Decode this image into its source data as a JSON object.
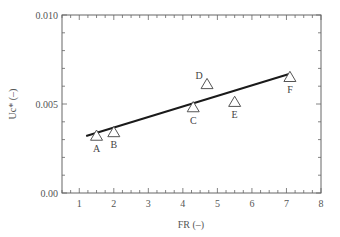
{
  "chart_data": {
    "type": "scatter",
    "title": "",
    "xlabel": "FR (–)",
    "ylabel": "Uc* (–)",
    "xlim": [
      0.5,
      8
    ],
    "ylim": [
      0.0,
      0.01
    ],
    "x_ticks": [
      1,
      2,
      3,
      4,
      5,
      6,
      7,
      8
    ],
    "y_ticks": [
      {
        "value": 0.0,
        "label": "0.00"
      },
      {
        "value": 0.005,
        "label": "0.005"
      },
      {
        "value": 0.01,
        "label": "0.010"
      }
    ],
    "grid": false,
    "legend": null,
    "series": [
      {
        "name": "Measured",
        "marker": "open-triangle",
        "points": [
          {
            "label": "A",
            "x": 1.5,
            "y": 0.0032
          },
          {
            "label": "B",
            "x": 2.0,
            "y": 0.0034
          },
          {
            "label": "C",
            "x": 4.3,
            "y": 0.0048
          },
          {
            "label": "D",
            "x": 4.7,
            "y": 0.0061
          },
          {
            "label": "E",
            "x": 5.5,
            "y": 0.0051
          },
          {
            "label": "F",
            "x": 7.1,
            "y": 0.0065
          }
        ]
      },
      {
        "name": "Fit line",
        "type": "line",
        "points": [
          {
            "x": 1.2,
            "y": 0.0032
          },
          {
            "x": 7.1,
            "y": 0.0067
          }
        ]
      }
    ]
  },
  "colors": {
    "axis": "#666666",
    "line": "#1a1a1a",
    "marker": "#555555"
  }
}
